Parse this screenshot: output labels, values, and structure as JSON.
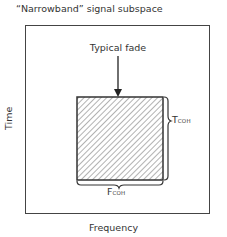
{
  "diagram": {
    "title": "“Narrowband” signal subspace",
    "x_axis_label": "Frequency",
    "y_axis_label": "Time",
    "region_label": "Typical fade",
    "vertical_dimension": {
      "main": "T",
      "subscript": "COH"
    },
    "horizontal_dimension": {
      "main": "F",
      "subscript": "COH"
    },
    "colors": {
      "stroke": "#444444",
      "hatch": "#666666",
      "background": "#ffffff"
    }
  }
}
